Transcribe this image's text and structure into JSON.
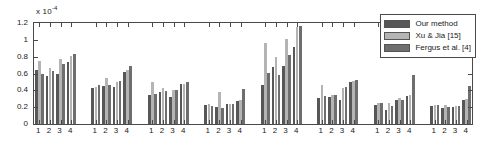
{
  "chart_data": {
    "type": "bar",
    "title": "",
    "subtitle": "",
    "xlabel": "",
    "ylabel": "",
    "y_multiplier_label": "x 10",
    "y_multiplier_exponent": "-4",
    "ylim": [
      0,
      1.2
    ],
    "yticks": [
      0,
      0.2,
      0.4,
      0.6,
      0.8,
      1,
      1.2
    ],
    "ytick_labels": [
      "0",
      "0.2",
      "0.4",
      "0.6",
      "0.8",
      "1",
      "1.2"
    ],
    "grid": false,
    "legend_position": "top-right",
    "group_count": 8,
    "categories": [
      "1",
      "2",
      "3",
      "4"
    ],
    "group_tick_labels": [
      [
        "1",
        "2",
        "3",
        "4"
      ],
      [
        "1",
        "2",
        "3",
        "4"
      ],
      [
        "1",
        "2",
        "3",
        "4"
      ],
      [
        "1",
        "2",
        "3",
        "4"
      ],
      [
        "1",
        "2",
        "3",
        "4"
      ],
      [
        "1",
        "2",
        "3",
        "4"
      ],
      [
        "1",
        "2",
        "3",
        "4"
      ],
      [
        "1",
        "2",
        "3",
        "4"
      ]
    ],
    "series": [
      {
        "name": "Our method",
        "color": "#575757",
        "values_by_group": [
          [
            0.645,
            0.565,
            0.6,
            0.74
          ],
          [
            0.425,
            0.45,
            0.44,
            0.62
          ],
          [
            0.35,
            0.385,
            0.325,
            0.47
          ],
          [
            0.225,
            0.2,
            0.235,
            0.27
          ],
          [
            0.465,
            0.675,
            0.69,
            0.915
          ],
          [
            0.31,
            0.325,
            0.28,
            0.5
          ],
          [
            0.225,
            0.165,
            0.28,
            0.335
          ],
          [
            0.215,
            0.195,
            0.205,
            0.28
          ]
        ]
      },
      {
        "name": "Xu & Jia [15]",
        "color": "#b4b4b4",
        "values_by_group": [
          [
            0.745,
            0.67,
            0.77,
            0.81
          ],
          [
            0.44,
            0.55,
            0.505,
            0.64
          ],
          [
            0.5,
            0.43,
            0.405,
            0.48
          ],
          [
            0.24,
            0.385,
            0.24,
            0.28
          ],
          [
            0.965,
            0.8,
            1.015,
            1.15
          ],
          [
            0.46,
            0.34,
            0.425,
            0.51
          ],
          [
            0.255,
            0.255,
            0.305,
            0.345
          ],
          [
            0.22,
            0.23,
            0.215,
            0.3
          ]
        ]
      },
      {
        "name": "Fergus et al. [4]",
        "color": "#6e6e6e",
        "values_by_group": [
          [
            0.595,
            0.63,
            0.71,
            0.835
          ],
          [
            0.46,
            0.46,
            0.51,
            0.69
          ],
          [
            0.355,
            0.39,
            0.4,
            0.505
          ],
          [
            0.215,
            0.195,
            0.24,
            0.415
          ],
          [
            0.61,
            0.58,
            0.82,
            1.17
          ],
          [
            0.33,
            0.35,
            0.435,
            0.525
          ],
          [
            0.245,
            0.215,
            0.29,
            0.58
          ],
          [
            0.22,
            0.2,
            0.21,
            0.45
          ]
        ]
      }
    ]
  },
  "legend": {
    "entries": [
      {
        "label": "Our method"
      },
      {
        "label": "Xu & Jia [15]"
      },
      {
        "label": "Fergus et al. [4]"
      }
    ]
  }
}
